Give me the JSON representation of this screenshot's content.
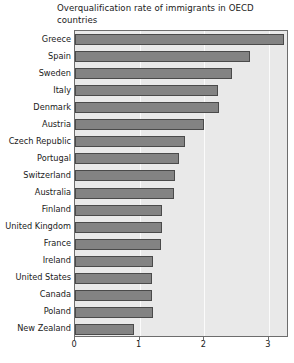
{
  "chart_data": {
    "type": "bar",
    "orientation": "horizontal",
    "title": "Overqualification rate of immigrants in OECD countries",
    "title_line1": "Overqualification rate of immigrants in OECD",
    "title_line2": "countries",
    "xlabel": "",
    "ylabel": "",
    "categories": [
      "Greece",
      "Spain",
      "Sweden",
      "Italy",
      "Denmark",
      "Austria",
      "Czech Republic",
      "Portugal",
      "Switzerland",
      "Australia",
      "Finland",
      "United Kingdom",
      "France",
      "Ireland",
      "United States",
      "Canada",
      "Poland",
      "New Zealand"
    ],
    "values": [
      3.24,
      2.7,
      2.43,
      2.21,
      2.22,
      1.99,
      1.7,
      1.61,
      1.55,
      1.53,
      1.34,
      1.34,
      1.33,
      1.2,
      1.19,
      1.19,
      1.2,
      0.91
    ],
    "xticks": [
      0,
      1,
      2,
      3
    ],
    "xtick_labels": [
      "0",
      "1",
      "2",
      "3"
    ],
    "xlim": [
      0,
      3.31
    ],
    "grid": true,
    "grid_axis": "x",
    "legend": null,
    "colors": {
      "bar_fill": "#838383",
      "bar_edge": "#4a4a4a",
      "plot_background": "#e9e9e9",
      "gridline": "#fbfbfb",
      "axis": "#6d6d6d",
      "text": "#1a1a1a",
      "figure_background": "#ffffff"
    }
  }
}
